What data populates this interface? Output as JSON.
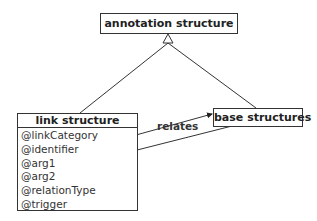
{
  "diagram": {
    "type": "uml-class-diagram",
    "parent": {
      "name": "annotation structure"
    },
    "children": [
      {
        "name": "link structure",
        "attributes": [
          "@linkCategory",
          "@identifier",
          "@arg1",
          "@arg2",
          "@relationType",
          "@trigger"
        ]
      },
      {
        "name": "base structures"
      }
    ],
    "relation": {
      "label": "relates",
      "from": [
        "@arg1"
      ],
      "to": [
        "base structures"
      ],
      "back_to": [
        "@arg2"
      ]
    },
    "inheritance_icon": "hollow-triangle"
  }
}
